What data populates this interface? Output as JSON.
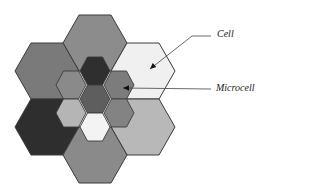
{
  "diagram": {
    "cell_geometry": {
      "half_width": 32,
      "half_height": 28,
      "edge_half": 16
    },
    "microcell_geometry": {
      "half_width": 15,
      "half_height": 14,
      "edge_half": 7.5
    },
    "stroke_color": "#3a3a3a",
    "cells": [
      {
        "name": "cell-top",
        "cx": 95,
        "cy": 43,
        "fill": "#8c8c8c"
      },
      {
        "name": "cell-upper-left",
        "cx": 47,
        "cy": 71,
        "fill": "#7a7a7a"
      },
      {
        "name": "cell-upper-right",
        "cx": 143,
        "cy": 71,
        "fill": "#f0f0f0"
      },
      {
        "name": "cell-lower-left",
        "cx": 47,
        "cy": 127,
        "fill": "#2e2e2e"
      },
      {
        "name": "cell-lower-right",
        "cx": 143,
        "cy": 127,
        "fill": "#b8b8b8"
      },
      {
        "name": "cell-bottom",
        "cx": 95,
        "cy": 155,
        "fill": "#8a8a8a"
      }
    ],
    "microcells": [
      {
        "name": "microcell-top",
        "cx": 95,
        "cy": 71,
        "fill": "#2f2f2f"
      },
      {
        "name": "microcell-upper-left",
        "cx": 71,
        "cy": 85,
        "fill": "#8a8a8a"
      },
      {
        "name": "microcell-upper-right",
        "cx": 119,
        "cy": 85,
        "fill": "#7c7c7c"
      },
      {
        "name": "microcell-center",
        "cx": 95,
        "cy": 99,
        "fill": "#5e5e5e"
      },
      {
        "name": "microcell-lower-left",
        "cx": 71,
        "cy": 113,
        "fill": "#b5b5b5"
      },
      {
        "name": "microcell-lower-right",
        "cx": 119,
        "cy": 113,
        "fill": "#838383"
      },
      {
        "name": "microcell-bottom",
        "cx": 95,
        "cy": 127,
        "fill": "#f3f3f3"
      }
    ],
    "labels": {
      "cell": "Cell",
      "microcell": "Microcell"
    },
    "callouts": {
      "cell": {
        "points": "211,36 192,36 150,69",
        "tip": [
          150,
          69
        ],
        "from": [
          158,
          62
        ]
      },
      "microcell": {
        "points": "211,89 123,88",
        "tip": [
          123,
          88
        ],
        "from": [
          132,
          88
        ]
      }
    }
  }
}
